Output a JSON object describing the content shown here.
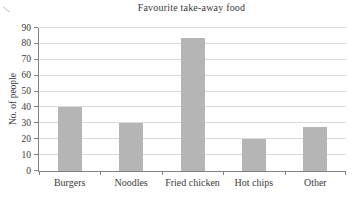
{
  "chart_data": {
    "type": "bar",
    "title": "Favourite take-away food",
    "xlabel": "",
    "ylabel": "No. of people",
    "categories": [
      "Burgers",
      "Noodles",
      "Fried chicken",
      "Hot chips",
      "Other"
    ],
    "values": [
      40,
      30,
      84,
      20,
      28
    ],
    "ylim": [
      0,
      90
    ],
    "yticks": [
      0,
      10,
      20,
      30,
      40,
      50,
      60,
      70,
      80,
      90
    ],
    "grid": true,
    "legend": "none",
    "colors": {
      "background": "#ffffff",
      "bar": "#b5b5b5",
      "gridline": "#dadada",
      "axis": "#828282",
      "text": "#3a3a3a"
    }
  }
}
